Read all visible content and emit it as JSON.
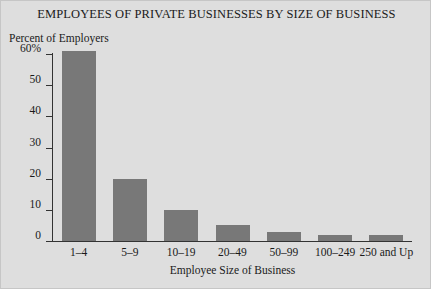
{
  "chart_data": {
    "type": "bar",
    "title": "EMPLOYEES OF PRIVATE BUSINESSES BY SIZE OF BUSINESS",
    "xlabel": "Employee Size of Business",
    "ylabel": "Percent of Employers",
    "categories": [
      "1–4",
      "5–9",
      "10–19",
      "20–49",
      "50–99",
      "100–249",
      "250 and Up"
    ],
    "values": [
      61,
      20,
      10,
      5,
      3,
      2,
      2
    ],
    "ylim": [
      0,
      60
    ],
    "yticks": [
      0,
      10,
      20,
      30,
      40,
      50,
      60
    ],
    "ytick_labels": [
      "0",
      "10",
      "20",
      "30",
      "40",
      "50",
      "60%"
    ],
    "grid": false,
    "legend": "none",
    "bar_color": "#787878",
    "axis_color": "#333333",
    "background_color": "#dedede",
    "text_color": "#1a1a1a"
  }
}
